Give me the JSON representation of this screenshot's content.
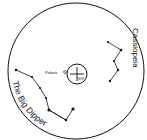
{
  "diagram": {
    "labels": {
      "polaris": "Polaris",
      "ncp": "NCP",
      "big_dipper": "The Big Dipper",
      "cassiopeia": "Cassiopeia"
    },
    "colors": {
      "stroke": "#111111",
      "background": "#ffffff"
    }
  }
}
